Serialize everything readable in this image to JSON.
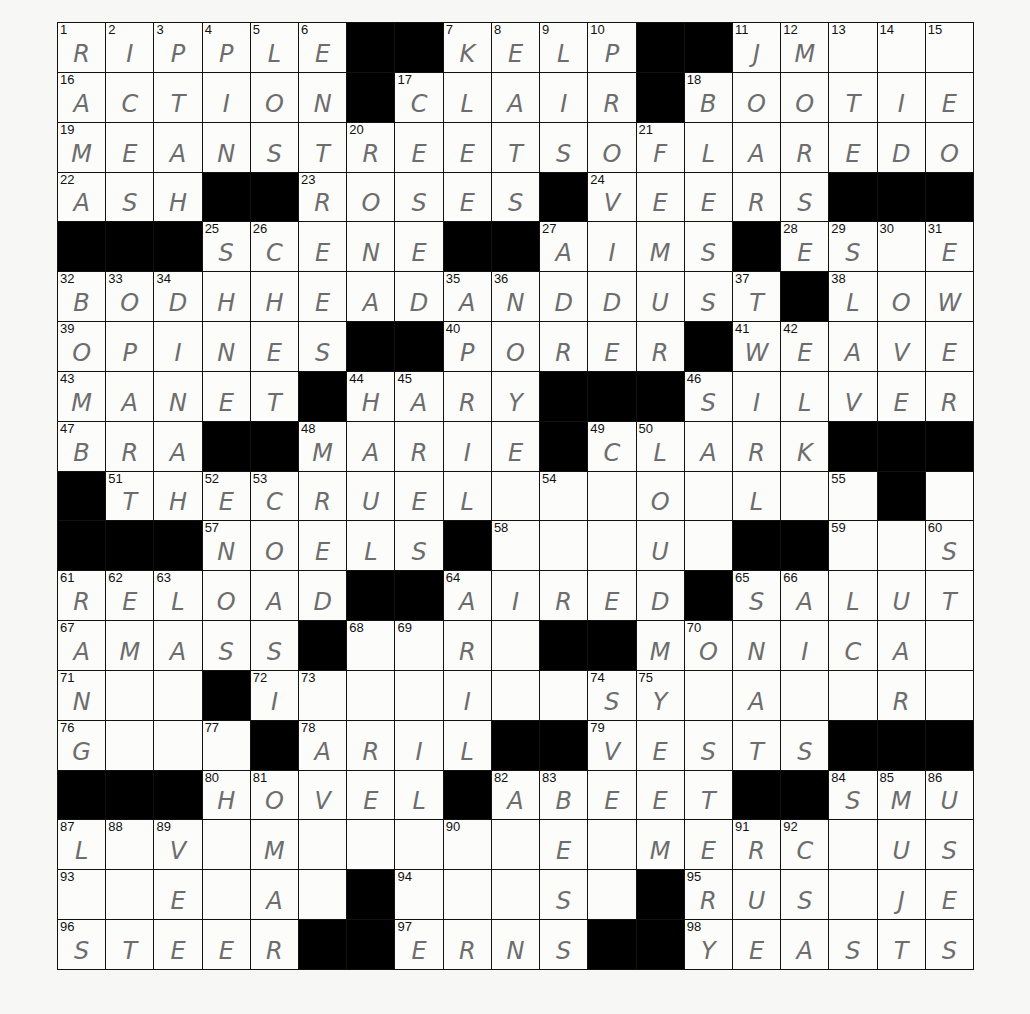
{
  "puzzle": {
    "rows": 19,
    "cols": 19,
    "grid": [
      "RIPPLE##KELP##JM___",
      "ACTION#CLAIR#BOOTIE",
      "MEANSTREETSOFLAREDO",
      "ASH##ROSES#VEERS###",
      "###SCENE##AIMS#ES_E",
      "BODHHEADANDDUST#LOW",
      "OPINES##PORER#WEAVE",
      "MANET#HARY###SILVER",
      "BRA##MARIE#CLARK###",
      "#THECRUEL_ _O_L__#",
      "###NOELS#___U_##__S",
      "RELOAD##AIRED#SALUT",
      "AMASS#__R_##MONICA",
      "N__#I___I__SY_A__R",
      "G___#ARIL##VESTS###",
      "###HOVEL#ABEET##SMU",
      "L_V_M___ _E_MERC_US",
      "__E_A_#___S_#RUS_JE",
      "STEER##ERNS##YEASTS"
    ],
    "numbers": [
      {
        "r": 0,
        "c": 0,
        "n": "1"
      },
      {
        "r": 0,
        "c": 1,
        "n": "2"
      },
      {
        "r": 0,
        "c": 2,
        "n": "3"
      },
      {
        "r": 0,
        "c": 3,
        "n": "4"
      },
      {
        "r": 0,
        "c": 4,
        "n": "5"
      },
      {
        "r": 0,
        "c": 5,
        "n": "6"
      },
      {
        "r": 0,
        "c": 8,
        "n": "7"
      },
      {
        "r": 0,
        "c": 9,
        "n": "8"
      },
      {
        "r": 0,
        "c": 10,
        "n": "9"
      },
      {
        "r": 0,
        "c": 11,
        "n": "10"
      },
      {
        "r": 0,
        "c": 14,
        "n": "11"
      },
      {
        "r": 0,
        "c": 15,
        "n": "12"
      },
      {
        "r": 0,
        "c": 16,
        "n": "13"
      },
      {
        "r": 0,
        "c": 17,
        "n": "14"
      },
      {
        "r": 0,
        "c": 18,
        "n": "15"
      },
      {
        "r": 1,
        "c": 0,
        "n": "16"
      },
      {
        "r": 1,
        "c": 7,
        "n": "17"
      },
      {
        "r": 1,
        "c": 13,
        "n": "18"
      },
      {
        "r": 2,
        "c": 0,
        "n": "19"
      },
      {
        "r": 2,
        "c": 6,
        "n": "20"
      },
      {
        "r": 2,
        "c": 12,
        "n": "21"
      },
      {
        "r": 3,
        "c": 0,
        "n": "22"
      },
      {
        "r": 3,
        "c": 5,
        "n": "23"
      },
      {
        "r": 3,
        "c": 11,
        "n": "24"
      },
      {
        "r": 4,
        "c": 3,
        "n": "25"
      },
      {
        "r": 4,
        "c": 4,
        "n": "26"
      },
      {
        "r": 4,
        "c": 10,
        "n": "27"
      },
      {
        "r": 4,
        "c": 15,
        "n": "28"
      },
      {
        "r": 4,
        "c": 16,
        "n": "29"
      },
      {
        "r": 4,
        "c": 17,
        "n": "30"
      },
      {
        "r": 4,
        "c": 18,
        "n": "31"
      },
      {
        "r": 5,
        "c": 0,
        "n": "32"
      },
      {
        "r": 5,
        "c": 1,
        "n": "33"
      },
      {
        "r": 5,
        "c": 2,
        "n": "34"
      },
      {
        "r": 5,
        "c": 8,
        "n": "35"
      },
      {
        "r": 5,
        "c": 9,
        "n": "36"
      },
      {
        "r": 5,
        "c": 14,
        "n": "37"
      },
      {
        "r": 5,
        "c": 16,
        "n": "38"
      },
      {
        "r": 6,
        "c": 0,
        "n": "39"
      },
      {
        "r": 6,
        "c": 8,
        "n": "40"
      },
      {
        "r": 6,
        "c": 14,
        "n": "41"
      },
      {
        "r": 6,
        "c": 15,
        "n": "42"
      },
      {
        "r": 7,
        "c": 0,
        "n": "43"
      },
      {
        "r": 7,
        "c": 6,
        "n": "44"
      },
      {
        "r": 7,
        "c": 7,
        "n": "45"
      },
      {
        "r": 7,
        "c": 13,
        "n": "46"
      },
      {
        "r": 8,
        "c": 0,
        "n": "47"
      },
      {
        "r": 8,
        "c": 5,
        "n": "48"
      },
      {
        "r": 8,
        "c": 11,
        "n": "49"
      },
      {
        "r": 8,
        "c": 12,
        "n": "50"
      },
      {
        "r": 9,
        "c": 1,
        "n": "51"
      },
      {
        "r": 9,
        "c": 3,
        "n": "52"
      },
      {
        "r": 9,
        "c": 4,
        "n": "53"
      },
      {
        "r": 9,
        "c": 10,
        "n": "54"
      },
      {
        "r": 9,
        "c": 16,
        "n": "55"
      },
      {
        "r": 9,
        "c": 17,
        "n": "56"
      },
      {
        "r": 10,
        "c": 3,
        "n": "57"
      },
      {
        "r": 10,
        "c": 9,
        "n": "58"
      },
      {
        "r": 10,
        "c": 16,
        "n": "59"
      },
      {
        "r": 10,
        "c": 18,
        "n": "60"
      },
      {
        "r": 11,
        "c": 0,
        "n": "61"
      },
      {
        "r": 11,
        "c": 1,
        "n": "62"
      },
      {
        "r": 11,
        "c": 2,
        "n": "63"
      },
      {
        "r": 11,
        "c": 8,
        "n": "64"
      },
      {
        "r": 11,
        "c": 14,
        "n": "65"
      },
      {
        "r": 11,
        "c": 15,
        "n": "66"
      },
      {
        "r": 12,
        "c": 0,
        "n": "67"
      },
      {
        "r": 12,
        "c": 6,
        "n": "68"
      },
      {
        "r": 12,
        "c": 7,
        "n": "69"
      },
      {
        "r": 12,
        "c": 13,
        "n": "70"
      },
      {
        "r": 13,
        "c": 0,
        "n": "71"
      },
      {
        "r": 13,
        "c": 4,
        "n": "72"
      },
      {
        "r": 13,
        "c": 5,
        "n": "73"
      },
      {
        "r": 13,
        "c": 11,
        "n": "74"
      },
      {
        "r": 13,
        "c": 12,
        "n": "75"
      },
      {
        "r": 14,
        "c": 0,
        "n": "76"
      },
      {
        "r": 14,
        "c": 3,
        "n": "77"
      },
      {
        "r": 14,
        "c": 5,
        "n": "78"
      },
      {
        "r": 14,
        "c": 11,
        "n": "79"
      },
      {
        "r": 15,
        "c": 3,
        "n": "80"
      },
      {
        "r": 15,
        "c": 4,
        "n": "81"
      },
      {
        "r": 15,
        "c": 9,
        "n": "82"
      },
      {
        "r": 15,
        "c": 10,
        "n": "83"
      },
      {
        "r": 15,
        "c": 16,
        "n": "84"
      },
      {
        "r": 15,
        "c": 17,
        "n": "85"
      },
      {
        "r": 15,
        "c": 18,
        "n": "86"
      },
      {
        "r": 16,
        "c": 0,
        "n": "87"
      },
      {
        "r": 16,
        "c": 1,
        "n": "88"
      },
      {
        "r": 16,
        "c": 2,
        "n": "89"
      },
      {
        "r": 16,
        "c": 8,
        "n": "90"
      },
      {
        "r": 16,
        "c": 14,
        "n": "91"
      },
      {
        "r": 16,
        "c": 15,
        "n": "92"
      },
      {
        "r": 17,
        "c": 0,
        "n": "93"
      },
      {
        "r": 17,
        "c": 7,
        "n": "94"
      },
      {
        "r": 17,
        "c": 13,
        "n": "95"
      },
      {
        "r": 18,
        "c": 0,
        "n": "96"
      },
      {
        "r": 18,
        "c": 7,
        "n": "97"
      },
      {
        "r": 18,
        "c": 13,
        "n": "98"
      }
    ]
  }
}
